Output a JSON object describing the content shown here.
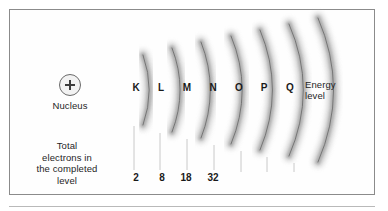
{
  "figure": {
    "title_alt": "Atomic energy level shell diagram",
    "background_color": "#ffffff",
    "frame_color": "#8b8b8b",
    "arc_color": "#6f6f6f",
    "text_color": "#1f1f1f"
  },
  "nucleus": {
    "symbol": "+",
    "label": "Nucleus"
  },
  "annotations": {
    "energy_level_line1": "Energy",
    "energy_level_line2": "level",
    "total_electrons_line1": "Total",
    "total_electrons_line2": "electrons in",
    "total_electrons_line3": "the completed",
    "total_electrons_line4": "level"
  },
  "chart_data": {
    "type": "diagram",
    "xlabel": "",
    "ylabel": "",
    "categories": [
      "K",
      "L",
      "M",
      "N",
      "O",
      "P",
      "Q"
    ],
    "values": [
      2,
      8,
      18,
      32,
      null,
      null,
      null
    ],
    "series": [
      {
        "name": "Total electrons in the completed level",
        "values": [
          2,
          8,
          18,
          32,
          null,
          null,
          null
        ]
      }
    ],
    "legend": [
      "Nucleus",
      "Energy level",
      "Total electrons in the completed level"
    ],
    "annotations": [
      "Nucleus",
      "Energy level",
      "Total electrons in the completed level"
    ],
    "grid": false,
    "legend_position": "inline"
  },
  "shells": [
    {
      "letter": "K",
      "count": "2",
      "letter_x": 128,
      "count_x": 126,
      "arc_x_top": 143,
      "arc_x_mid": 133,
      "arc_x_bot": 143,
      "arc_top": 55,
      "arc_bot": 125,
      "tick_x": 134,
      "tick_top": 126,
      "tick_bot": 170
    },
    {
      "letter": "L",
      "count": "8",
      "letter_x": 153,
      "count_x": 152,
      "arc_x_top": 172,
      "arc_x_mid": 159,
      "arc_x_bot": 172,
      "arc_top": 48,
      "arc_bot": 132,
      "tick_x": 160,
      "tick_top": 133,
      "tick_bot": 170
    },
    {
      "letter": "M",
      "count": "18",
      "letter_x": 179,
      "count_x": 176,
      "arc_x_top": 201,
      "arc_x_mid": 186,
      "arc_x_bot": 201,
      "arc_top": 42,
      "arc_bot": 138,
      "tick_x": 187,
      "tick_top": 139,
      "tick_bot": 170
    },
    {
      "letter": "N",
      "count": "32",
      "letter_x": 205,
      "count_x": 203,
      "arc_x_top": 231,
      "arc_x_mid": 213,
      "arc_x_bot": 231,
      "arc_top": 36,
      "arc_bot": 144,
      "tick_x": 214,
      "tick_top": 145,
      "tick_bot": 170
    },
    {
      "letter": "O",
      "count": "",
      "letter_x": 231,
      "count_x": 229,
      "arc_x_top": 260,
      "arc_x_mid": 240,
      "arc_x_bot": 260,
      "arc_top": 30,
      "arc_bot": 150,
      "tick_x": 241,
      "tick_top": 151,
      "tick_bot": 172
    },
    {
      "letter": "P",
      "count": "",
      "letter_x": 256,
      "count_x": 255,
      "arc_x_top": 289,
      "arc_x_mid": 266,
      "arc_x_bot": 289,
      "arc_top": 24,
      "arc_bot": 156,
      "tick_x": 267,
      "tick_top": 157,
      "tick_bot": 172
    },
    {
      "letter": "Q",
      "count": "",
      "letter_x": 282,
      "count_x": 281,
      "arc_x_top": 318,
      "arc_x_mid": 293,
      "arc_x_bot": 318,
      "arc_top": 18,
      "arc_bot": 162,
      "tick_x": 294,
      "tick_top": 163,
      "tick_bot": 172
    }
  ]
}
